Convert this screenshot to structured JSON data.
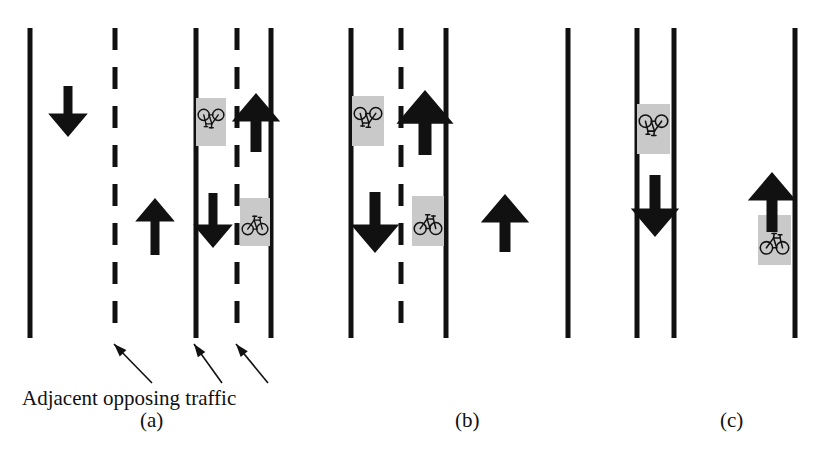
{
  "figure": {
    "type": "diagram",
    "background_color": "#ffffff",
    "line_color": "#111111",
    "icon_panel_color": "#c9c9c9",
    "arrow_color": "#111111"
  },
  "annotation": {
    "text": "Adjacent opposing traffic",
    "leader_count": 3,
    "leader_targets": [
      "centerline-dashed",
      "solid-lane-edge",
      "bike-lane-dashed"
    ]
  },
  "panels": [
    {
      "id": "a",
      "label": "(a)",
      "label_x": 140,
      "label_y": 420,
      "lines": [
        {
          "name": "outer-left-solid",
          "x": 30,
          "style": "solid",
          "y1": 28,
          "y2": 338
        },
        {
          "name": "centerline-dashed",
          "x": 115,
          "style": "dashed",
          "y1": 28,
          "y2": 338
        },
        {
          "name": "lane-edge-solid",
          "x": 196,
          "style": "solid",
          "y1": 28,
          "y2": 338
        },
        {
          "name": "bike-lane-dashed",
          "x": 237,
          "style": "dashed",
          "y1": 28,
          "y2": 338
        },
        {
          "name": "outer-right-solid",
          "x": 271,
          "style": "solid",
          "y1": 28,
          "y2": 338
        }
      ],
      "arrows": [
        {
          "name": "arrow-down-far-left-lane",
          "x": 68,
          "y_top": 86,
          "y_bottom": 137,
          "dir": "down",
          "width": 9
        },
        {
          "name": "arrow-up-inner-left-lane",
          "x": 155,
          "y_top": 198,
          "y_bottom": 255,
          "dir": "up",
          "width": 9
        },
        {
          "name": "arrow-up-right-lane",
          "x": 256,
          "y_top": 93,
          "y_bottom": 152,
          "dir": "up",
          "width": 11
        },
        {
          "name": "arrow-down-right-lane",
          "x": 213,
          "y_top": 193,
          "y_bottom": 248,
          "dir": "down",
          "width": 9
        }
      ],
      "bike_icons": [
        {
          "name": "bike-icon-inverted",
          "x": 196,
          "y": 98,
          "w": 30,
          "h": 48,
          "orientation": "inverted"
        },
        {
          "name": "bike-icon-upright",
          "x": 240,
          "y": 198,
          "w": 30,
          "h": 48,
          "orientation": "upright"
        }
      ]
    },
    {
      "id": "b",
      "label": "(b)",
      "label_x": 455,
      "label_y": 420,
      "lines": [
        {
          "name": "outer-left-solid",
          "x": 351,
          "style": "solid",
          "y1": 28,
          "y2": 338
        },
        {
          "name": "centerline-dashed",
          "x": 401,
          "style": "dashed",
          "y1": 28,
          "y2": 338
        },
        {
          "name": "outer-right-solid",
          "x": 446,
          "style": "solid",
          "y1": 28,
          "y2": 338
        }
      ],
      "arrows": [
        {
          "name": "arrow-up-right-lane",
          "x": 425,
          "y_top": 90,
          "y_bottom": 155,
          "dir": "up",
          "width": 13
        },
        {
          "name": "arrow-down-left-lane",
          "x": 375,
          "y_top": 192,
          "y_bottom": 253,
          "dir": "down",
          "width": 11
        },
        {
          "name": "arrow-up-isolated",
          "x": 505,
          "y_top": 194,
          "y_bottom": 252,
          "dir": "up",
          "width": 11
        }
      ],
      "bike_icons": [
        {
          "name": "bike-icon-inverted",
          "x": 352,
          "y": 96,
          "w": 32,
          "h": 50,
          "orientation": "inverted"
        },
        {
          "name": "bike-icon-upright",
          "x": 412,
          "y": 196,
          "w": 32,
          "h": 50,
          "orientation": "upright"
        }
      ]
    },
    {
      "id": "c",
      "label": "(c)",
      "label_x": 720,
      "label_y": 420,
      "lines": [
        {
          "name": "outer-left-solid",
          "x": 568,
          "style": "solid",
          "y1": 28,
          "y2": 338
        },
        {
          "name": "bike-lane-left-solid",
          "x": 637,
          "style": "solid",
          "y1": 28,
          "y2": 338
        },
        {
          "name": "bike-lane-right-solid",
          "x": 674,
          "style": "solid",
          "y1": 28,
          "y2": 338
        },
        {
          "name": "outer-right-solid",
          "x": 795,
          "style": "solid",
          "y1": 28,
          "y2": 338
        }
      ],
      "arrows": [
        {
          "name": "arrow-down-bike-lane",
          "x": 655,
          "y_top": 175,
          "y_bottom": 237,
          "dir": "down",
          "width": 11
        },
        {
          "name": "arrow-up-right-lane",
          "x": 772,
          "y_top": 172,
          "y_bottom": 232,
          "dir": "up",
          "width": 11
        }
      ],
      "bike_icons": [
        {
          "name": "bike-icon-inverted",
          "x": 637,
          "y": 104,
          "w": 33,
          "h": 50,
          "orientation": "inverted"
        },
        {
          "name": "bike-icon-upright",
          "x": 758,
          "y": 215,
          "w": 33,
          "h": 50,
          "orientation": "upright"
        }
      ]
    }
  ]
}
